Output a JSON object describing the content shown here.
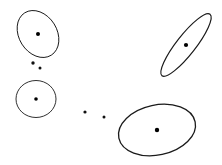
{
  "figure": {
    "canvas": {
      "width": 222,
      "height": 165,
      "background_color": "#ffffff"
    },
    "style": {
      "ellipse_stroke_color": "#1a1a1a",
      "center_dot_color": "#000000",
      "scatter_dot_color": "#111111"
    }
  },
  "chart_data": {
    "type": "scatter",
    "title": "",
    "xlabel": "",
    "ylabel": "",
    "xlim": [
      0,
      222
    ],
    "ylim": [
      0,
      165
    ],
    "grid": false,
    "legend": "none",
    "axes_visible": false,
    "clusters": [
      {
        "name": "cluster-top-left",
        "center": [
          38,
          34
        ],
        "radius_x": 19,
        "radius_y": 25,
        "rotation_deg": -32,
        "stroke_width": 1.0,
        "center_dot_radius": 2.0
      },
      {
        "name": "cluster-left-lower",
        "center": [
          36,
          99
        ],
        "radius_x": 20,
        "radius_y": 18.5,
        "rotation_deg": 0,
        "stroke_width": 0.9,
        "center_dot_radius": 1.8
      },
      {
        "name": "cluster-top-right",
        "center": [
          186,
          45
        ],
        "radius_x": 9.5,
        "radius_y": 39,
        "rotation_deg": 38,
        "stroke_width": 1.2,
        "center_dot_radius": 2.1
      },
      {
        "name": "cluster-bottom-right",
        "center": [
          157,
          130
        ],
        "radius_x": 39,
        "radius_y": 25,
        "rotation_deg": -12,
        "stroke_width": 1.3,
        "center_dot_radius": 2.2
      }
    ],
    "outlier_points": [
      {
        "name": "outlier-upper-left-a",
        "x": 33,
        "y": 63,
        "radius": 1.7
      },
      {
        "name": "outlier-upper-left-b",
        "x": 40,
        "y": 68,
        "radius": 1.5
      },
      {
        "name": "outlier-middle-a",
        "x": 85,
        "y": 112,
        "radius": 1.6
      },
      {
        "name": "outlier-middle-b",
        "x": 104,
        "y": 117,
        "radius": 1.5
      }
    ]
  }
}
